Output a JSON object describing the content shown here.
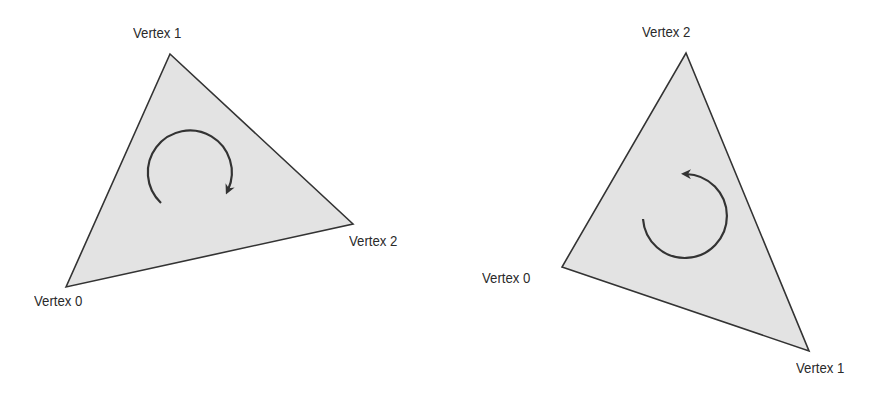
{
  "colors": {
    "fill": "#e3e3e3",
    "stroke": "#333333",
    "text": "#2a2a2a"
  },
  "diagrams": [
    {
      "name": "clockwise",
      "winding": "clockwise",
      "vertices": [
        {
          "label": "Vertex 0",
          "x": 66,
          "y": 287
        },
        {
          "label": "Vertex 1",
          "x": 170,
          "y": 54
        },
        {
          "label": "Vertex 2",
          "x": 353,
          "y": 224
        }
      ]
    },
    {
      "name": "counter-clockwise",
      "winding": "counter-clockwise",
      "vertices": [
        {
          "label": "Vertex 0",
          "x": 562,
          "y": 267
        },
        {
          "label": "Vertex 1",
          "x": 809,
          "y": 351
        },
        {
          "label": "Vertex 2",
          "x": 686,
          "y": 53
        }
      ]
    }
  ]
}
